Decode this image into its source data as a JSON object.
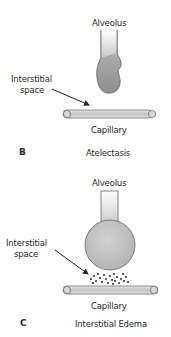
{
  "panels": [
    {
      "letter": "B",
      "title": "Atelectasis",
      "labels": {
        "alveolus": "Alveolus",
        "interstitial_line1": "Interstitial",
        "interstitial_line2": "space",
        "capillary": "Capillary"
      }
    },
    {
      "letter": "C",
      "title": "Interstitial Edema",
      "labels": {
        "alveolus": "Alveolus",
        "interstitial_line1": "Interstitial",
        "interstitial_line2": "space",
        "capillary": "Capillary"
      }
    }
  ],
  "colors": {
    "alveolus_fill": "#a8a8a8",
    "alveolus_stem": "#c9c9c9",
    "capillary_fill": "#cfcfcf",
    "outline": "#555555",
    "fluid_dots": "#1a1a1a"
  }
}
